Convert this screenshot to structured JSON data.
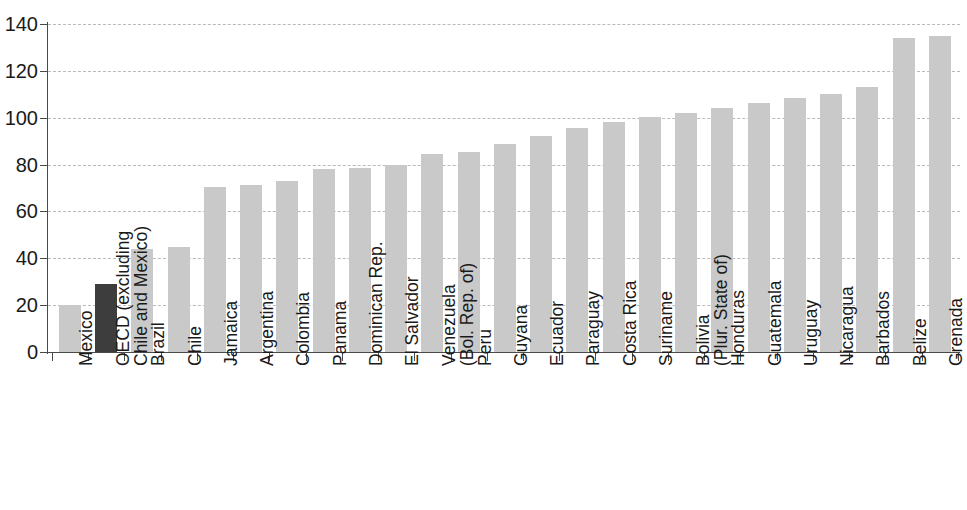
{
  "chart_data": {
    "type": "bar",
    "title": "",
    "subtitle": "",
    "xlabel": "",
    "ylabel": "",
    "ylim": [
      0,
      140
    ],
    "yticks": [
      0,
      20,
      40,
      60,
      80,
      100,
      120,
      140
    ],
    "ytick_labels": [
      "0",
      "20",
      "40",
      "60",
      "80",
      "100",
      "120",
      "140"
    ],
    "grid": true,
    "legend": "none",
    "highlight_color": "#3d3d3d",
    "bar_color": "#c9c9c9",
    "axis_color": "#4a4a4a",
    "gridline_color": "#b9b9b9",
    "categories": [
      "Mexico",
      "OECD (excluding Chile and Mexico)",
      "Brazil",
      "Chile",
      "Jamaica",
      "Argentina",
      "Colombia",
      "Panama",
      "Dominican Rep.",
      "El Salvador",
      "Venezuela (Bol. Rep. of)",
      "Peru",
      "Guyana",
      "Ecuador",
      "Paraguay",
      "Costa Rica",
      "Suriname",
      "Bolivia (Plur. State of)",
      "Honduras",
      "Guatemala",
      "Uruguay",
      "Nicaragua",
      "Barbados",
      "Belize",
      "Grenada"
    ],
    "category_label_lines": [
      [
        "Mexico",
        ""
      ],
      [
        "OECD (excluding",
        "Chile and Mexico)"
      ],
      [
        "Brazil",
        ""
      ],
      [
        "Chile",
        ""
      ],
      [
        "Jamaica",
        ""
      ],
      [
        "Argentina",
        ""
      ],
      [
        "Colombia",
        ""
      ],
      [
        "Panama",
        ""
      ],
      [
        "Dominican Rep.",
        ""
      ],
      [
        "El Salvador",
        ""
      ],
      [
        "Venezuela",
        "(Bol. Rep. of)"
      ],
      [
        "Peru",
        ""
      ],
      [
        "Guyana",
        ""
      ],
      [
        "Ecuador",
        ""
      ],
      [
        "Paraguay",
        ""
      ],
      [
        "Costa Rica",
        ""
      ],
      [
        "Suriname",
        ""
      ],
      [
        "Bolivia",
        "(Plur. State of)"
      ],
      [
        "Honduras",
        ""
      ],
      [
        "Guatemala",
        ""
      ],
      [
        "Uruguay",
        ""
      ],
      [
        "Nicaragua",
        ""
      ],
      [
        "Barbados",
        ""
      ],
      [
        "Belize",
        ""
      ],
      [
        "Grenada",
        ""
      ]
    ],
    "values": [
      20,
      29,
      44,
      45,
      70.5,
      71.5,
      73,
      78,
      78.5,
      80,
      84.5,
      85.5,
      89,
      92,
      95.5,
      98,
      100.5,
      102,
      104,
      106.5,
      108.5,
      110,
      113,
      134,
      135
    ],
    "highlighted_index": 1
  }
}
